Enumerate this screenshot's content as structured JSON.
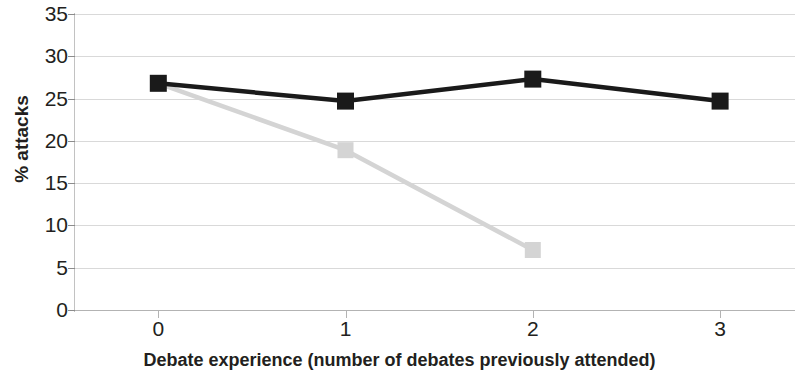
{
  "chart_data": {
    "type": "line",
    "title": "",
    "subtitle": "",
    "xlabel": "Debate experience (number of debates previously attended)",
    "ylabel": "% attacks",
    "x": [
      0,
      1,
      2,
      3
    ],
    "categories": [
      "0",
      "1",
      "2",
      "3"
    ],
    "xtick_labels": [
      "0",
      "1",
      "2",
      "3"
    ],
    "ytick_labels": [
      "0",
      "5",
      "10",
      "15",
      "20",
      "25",
      "30",
      "35"
    ],
    "yticks": [
      0,
      5,
      10,
      15,
      20,
      25,
      30,
      35
    ],
    "ylim": [
      0,
      35
    ],
    "xlim": [
      -0.45,
      3.4
    ],
    "grid": true,
    "grid_axis": "y",
    "legend": "none",
    "series": [
      {
        "name": "series-black",
        "color": "#1a1a1a",
        "marker": "square",
        "x": [
          0,
          1,
          2,
          3
        ],
        "values": [
          26.8,
          24.7,
          27.3,
          24.7
        ]
      },
      {
        "name": "series-gray",
        "color": "#d4d4d4",
        "marker": "square",
        "x": [
          0,
          1,
          2
        ],
        "values": [
          26.8,
          18.9,
          7.1
        ]
      }
    ]
  },
  "axes": {
    "y_title": "% attacks",
    "x_title": "Debate experience (number of debates previously attended)",
    "y_ticks": [
      {
        "label": "35",
        "value": 35
      },
      {
        "label": "30",
        "value": 30
      },
      {
        "label": "25",
        "value": 25
      },
      {
        "label": "20",
        "value": 20
      },
      {
        "label": "15",
        "value": 15
      },
      {
        "label": "10",
        "value": 10
      },
      {
        "label": "5",
        "value": 5
      },
      {
        "label": "0",
        "value": 0
      }
    ],
    "x_ticks": [
      {
        "label": "0",
        "value": 0
      },
      {
        "label": "1",
        "value": 1
      },
      {
        "label": "2",
        "value": 2
      },
      {
        "label": "3",
        "value": 3
      }
    ]
  },
  "colors": {
    "series_black": "#1a1a1a",
    "series_gray": "#d4d4d4",
    "gridline": "#d9d9d9",
    "axis": "#b3b3b3",
    "text": "#231f20",
    "background": "#ffffff"
  }
}
